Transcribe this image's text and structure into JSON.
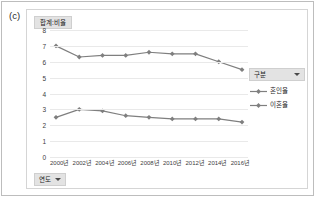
{
  "panel": {
    "label": "(c)"
  },
  "measure_selector": {
    "label": "합계:비율"
  },
  "dimension_selector": {
    "label": "연도",
    "caret_icon": "chevron-down-icon"
  },
  "legend": {
    "header": "구분",
    "header_caret_icon": "chevron-down-icon",
    "items": [
      {
        "label": "혼인율",
        "color": "#7f7f7f"
      },
      {
        "label": "이혼율",
        "color": "#7f7f7f"
      }
    ]
  },
  "chart_data": {
    "type": "line",
    "title": "합계:비율",
    "xlabel": "연도",
    "ylabel": "",
    "categories": [
      "2000년",
      "2002년",
      "2004년",
      "2006년",
      "2008년",
      "2010년",
      "2012년",
      "2014년",
      "2016년"
    ],
    "yticks": [
      8,
      7,
      6,
      5,
      4,
      3,
      2,
      1,
      0
    ],
    "ylim": [
      0,
      8
    ],
    "grid": true,
    "legend_position": "right",
    "series": [
      {
        "name": "혼인율",
        "color": "#7f7f7f",
        "marker": "diamond",
        "values": [
          7.0,
          6.3,
          6.4,
          6.4,
          6.6,
          6.5,
          6.5,
          6.0,
          5.5
        ]
      },
      {
        "name": "이혼율",
        "color": "#7f7f7f",
        "marker": "diamond",
        "values": [
          2.5,
          3.0,
          2.9,
          2.6,
          2.5,
          2.4,
          2.4,
          2.4,
          2.2
        ]
      }
    ]
  }
}
